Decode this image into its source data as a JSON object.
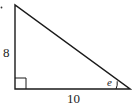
{
  "diagram": {
    "type": "right-triangle",
    "labels": {
      "vertical_leg": "8",
      "horizontal_leg": "10",
      "angle": "e"
    },
    "colors": {
      "stroke": "#1a1a1a",
      "text": "#222222",
      "background": "#ffffff"
    }
  }
}
